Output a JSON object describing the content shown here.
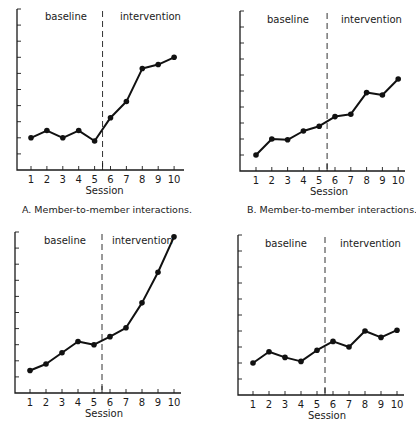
{
  "figure": {
    "panels": [
      {
        "id": "A",
        "caption": "A.  Member-to-member interactions."
      },
      {
        "id": "B",
        "caption": "B.  Member-to-member interactions."
      },
      {
        "id": "C",
        "caption": ""
      },
      {
        "id": "D",
        "caption": ""
      }
    ]
  },
  "chart_data": [
    {
      "type": "line",
      "panel": "A",
      "title": "",
      "caption": "A.  Member-to-member interactions.",
      "xlabel": "Session",
      "ylabel": "",
      "x": [
        1,
        2,
        3,
        4,
        5,
        6,
        7,
        8,
        9,
        10
      ],
      "series": [
        {
          "name": "interactions",
          "values": [
            2.0,
            2.45,
            2.0,
            2.45,
            1.8,
            3.25,
            4.25,
            6.3,
            6.55,
            7.0
          ]
        }
      ],
      "phases": [
        {
          "label": "baseline",
          "sessions": [
            1,
            5
          ]
        },
        {
          "label": "intervention",
          "sessions": [
            6,
            10
          ]
        }
      ],
      "phase_change_after_session": 5.5,
      "ylim": [
        0,
        10
      ],
      "y_ticks_unlabeled": 10,
      "grid": false,
      "legend": "none"
    },
    {
      "type": "line",
      "panel": "B",
      "title": "",
      "caption": "B.  Member-to-member interactions.",
      "xlabel": "Session",
      "ylabel": "",
      "x": [
        1,
        2,
        3,
        4,
        5,
        6,
        7,
        8,
        9,
        10
      ],
      "series": [
        {
          "name": "interactions",
          "values": [
            1.0,
            2.0,
            1.95,
            2.5,
            2.8,
            3.4,
            3.55,
            4.9,
            4.75,
            5.75
          ]
        }
      ],
      "phases": [
        {
          "label": "baseline",
          "sessions": [
            1,
            5
          ]
        },
        {
          "label": "intervention",
          "sessions": [
            6,
            10
          ]
        }
      ],
      "phase_change_after_session": 5.5,
      "ylim": [
        0,
        10
      ],
      "y_ticks_unlabeled": 10,
      "grid": false,
      "legend": "none"
    },
    {
      "type": "line",
      "panel": "C",
      "title": "",
      "caption": "",
      "xlabel": "Session",
      "ylabel": "",
      "x": [
        1,
        2,
        3,
        4,
        5,
        6,
        7,
        8,
        9,
        10
      ],
      "series": [
        {
          "name": "interactions",
          "values": [
            1.4,
            1.8,
            2.5,
            3.2,
            3.0,
            3.5,
            4.05,
            5.6,
            7.5,
            9.7
          ]
        }
      ],
      "phases": [
        {
          "label": "baseline",
          "sessions": [
            1,
            5
          ]
        },
        {
          "label": "intervention",
          "sessions": [
            6,
            10
          ]
        }
      ],
      "phase_change_after_session": 5.5,
      "ylim": [
        0,
        10
      ],
      "y_ticks_unlabeled": 10,
      "grid": false,
      "legend": "none"
    },
    {
      "type": "line",
      "panel": "D",
      "title": "",
      "caption": "",
      "xlabel": "Session",
      "ylabel": "",
      "x": [
        1,
        2,
        3,
        4,
        5,
        6,
        7,
        8,
        9,
        10
      ],
      "series": [
        {
          "name": "interactions",
          "values": [
            2.0,
            2.7,
            2.35,
            2.1,
            2.8,
            3.35,
            3.0,
            4.0,
            3.6,
            4.05
          ]
        }
      ],
      "phases": [
        {
          "label": "baseline",
          "sessions": [
            1,
            5
          ]
        },
        {
          "label": "intervention",
          "sessions": [
            6,
            10
          ]
        }
      ],
      "phase_change_after_session": 5.5,
      "ylim": [
        0,
        10
      ],
      "y_ticks_unlabeled": 10,
      "grid": false,
      "legend": "none"
    }
  ]
}
